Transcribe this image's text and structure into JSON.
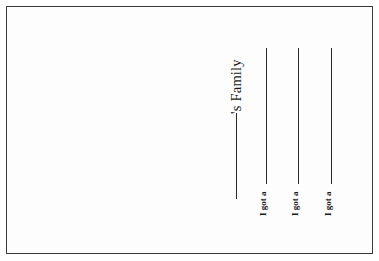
{
  "worksheet": {
    "title_suffix": "'s Family",
    "prompts": [
      {
        "label": "I got a"
      },
      {
        "label": "I got a"
      },
      {
        "label": "I got a"
      }
    ]
  },
  "colors": {
    "ink": "#1a1a1a",
    "border": "#3a3a3a",
    "paper": "#ffffff"
  }
}
